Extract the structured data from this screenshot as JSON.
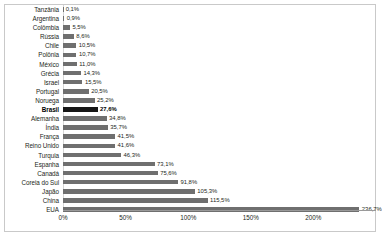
{
  "chart_data": {
    "type": "bar",
    "orientation": "horizontal",
    "title": "",
    "subtitle": "",
    "xlabel": "",
    "ylabel": "",
    "xlim": [
      0,
      236.7
    ],
    "axis_max_display": 250,
    "grid": false,
    "legend": null,
    "value_suffix": "%",
    "decimal_separator": ",",
    "highlight_category": "Brasil",
    "categories": [
      "Tanzânia",
      "Argentina",
      "Colômbia",
      "Rússia",
      "Chile",
      "Polônia",
      "México",
      "Grécia",
      "Israel",
      "Portugal",
      "Noruega",
      "Brasil",
      "Alemanha",
      "Índia",
      "França",
      "Reino Unido",
      "Turquia",
      "Espanha",
      "Canadá",
      "Coreia do Sul",
      "Japão",
      "China",
      "EUA"
    ],
    "values": [
      0.1,
      0.9,
      5.5,
      8.6,
      10.5,
      10.7,
      11.0,
      14.3,
      15.5,
      20.5,
      25.2,
      27.6,
      34.8,
      35.7,
      41.5,
      41.6,
      46.3,
      73.1,
      75.6,
      91.8,
      105.3,
      115.5,
      236.7
    ],
    "value_labels": [
      "0,1%",
      "0,9%",
      "5,5%",
      "8,6%",
      "10,5%",
      "10,7%",
      "11,0%",
      "14,3%",
      "15,5%",
      "20,5%",
      "25,2%",
      "27,6%",
      "34,8%",
      "35,7%",
      "41,5%",
      "41,6%",
      "46,3%",
      "73,1%",
      "75,6%",
      "91,8%",
      "105,3%",
      "115,5%",
      "236,7%"
    ],
    "xticks": [
      0,
      50,
      100,
      150,
      200
    ],
    "xtick_labels": [
      "0%",
      "50%",
      "100%",
      "150%",
      "200%"
    ]
  },
  "colors": {
    "bar": "#6f6f6f",
    "bar_highlight": "#161616",
    "text": "#231f20",
    "frame": "#c9c9c9",
    "axis": "#9a9a9a",
    "background": "#ffffff"
  },
  "caption": {
    "text": ""
  }
}
